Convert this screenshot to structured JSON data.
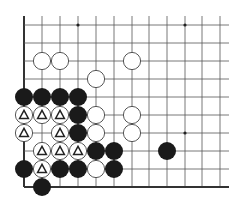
{
  "board": {
    "columns_x": [
      24,
      42,
      60,
      78,
      96,
      114,
      132,
      149,
      167,
      185,
      202,
      220
    ],
    "rows_y": [
      25,
      43,
      61,
      79,
      97,
      115,
      133,
      151,
      169,
      187
    ],
    "right_extent": 229,
    "top_extent": 16,
    "edge_left": true,
    "edge_bottom": true,
    "stone_radius": 9,
    "line_color": "#555555",
    "edge_color": "#333333",
    "black_color": "#1a1a1a",
    "white_fill": "#ffffff",
    "white_stroke": "#444444",
    "star_points": [
      [
        3,
        0
      ],
      [
        9,
        0
      ],
      [
        9,
        6
      ]
    ],
    "stones": {
      "white": [
        [
          1,
          2
        ],
        [
          2,
          2
        ],
        [
          6,
          2
        ],
        [
          4,
          3
        ],
        [
          4,
          5
        ],
        [
          6,
          5
        ],
        [
          4,
          6
        ],
        [
          6,
          6
        ],
        [
          4,
          8
        ]
      ],
      "white_marked": [
        [
          0,
          5
        ],
        [
          1,
          5
        ],
        [
          2,
          5
        ],
        [
          0,
          6
        ],
        [
          2,
          6
        ],
        [
          1,
          7
        ],
        [
          2,
          7
        ],
        [
          3,
          7
        ],
        [
          1,
          8
        ]
      ],
      "black": [
        [
          0,
          4
        ],
        [
          1,
          4
        ],
        [
          2,
          4
        ],
        [
          3,
          4
        ],
        [
          3,
          5
        ],
        [
          3,
          6
        ],
        [
          4,
          7
        ],
        [
          5,
          7
        ],
        [
          8,
          7
        ],
        [
          0,
          8
        ],
        [
          2,
          8
        ],
        [
          3,
          8
        ],
        [
          5,
          8
        ],
        [
          1,
          9
        ]
      ]
    },
    "marker": "triangle"
  }
}
